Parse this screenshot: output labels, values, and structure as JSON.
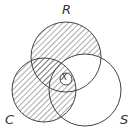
{
  "diagram": {
    "type": "venn",
    "sets": [
      {
        "label": "R",
        "shaded": true,
        "note": "R shaded except R∩S outside C"
      },
      {
        "label": "C",
        "shaded": true
      },
      {
        "label": "S",
        "shaded": false,
        "note": "S∩C shaded"
      }
    ],
    "center_marker": "X",
    "colors": {
      "stroke": "#444444",
      "hatch": "#555555"
    }
  }
}
